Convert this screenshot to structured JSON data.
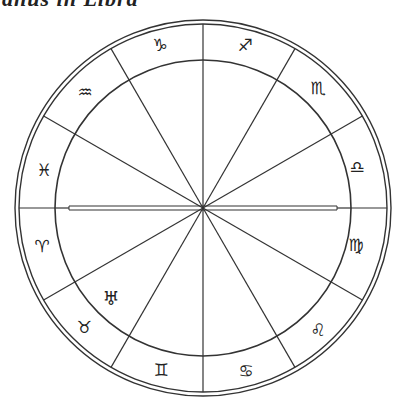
{
  "title": "anus in Libra",
  "wheel": {
    "center": [
      203,
      208
    ],
    "outer_radius": 188,
    "outer_inner_radius": 184,
    "inner_radius": 148,
    "stroke_color": "#333333",
    "cusp_angles_deg": [
      0,
      30,
      60,
      90,
      120,
      150,
      180,
      210,
      240,
      270,
      300,
      330
    ],
    "signs": [
      {
        "name": "aries",
        "glyph": "♈",
        "x": 42,
        "y": 246
      },
      {
        "name": "taurus",
        "glyph": "♉",
        "x": 84,
        "y": 327
      },
      {
        "name": "gemini",
        "glyph": "♊",
        "x": 161,
        "y": 370
      },
      {
        "name": "cancer",
        "glyph": "♋",
        "x": 246,
        "y": 371
      },
      {
        "name": "leo",
        "glyph": "♌",
        "x": 318,
        "y": 330
      },
      {
        "name": "virgo",
        "glyph": "♍",
        "x": 356,
        "y": 245
      },
      {
        "name": "libra",
        "glyph": "♎",
        "x": 357,
        "y": 167
      },
      {
        "name": "scorpio",
        "glyph": "♏",
        "x": 318,
        "y": 88
      },
      {
        "name": "sagittarius",
        "glyph": "♐",
        "x": 245,
        "y": 45
      },
      {
        "name": "capricorn",
        "glyph": "♑",
        "x": 160,
        "y": 45
      },
      {
        "name": "aquarius",
        "glyph": "♒",
        "x": 85,
        "y": 92
      },
      {
        "name": "pisces",
        "glyph": "♓",
        "x": 44,
        "y": 170
      }
    ],
    "planets": [
      {
        "name": "uranus",
        "glyph": "♅",
        "x": 111,
        "y": 298
      }
    ]
  }
}
